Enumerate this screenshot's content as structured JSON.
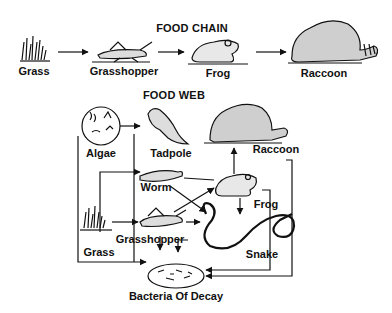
{
  "food_chain": {
    "title": "FOOD CHAIN",
    "nodes": [
      {
        "id": "grass",
        "label": "Grass"
      },
      {
        "id": "grasshopper",
        "label": "Grasshopper"
      },
      {
        "id": "frog",
        "label": "Frog"
      },
      {
        "id": "raccoon",
        "label": "Raccoon"
      }
    ],
    "edges": [
      [
        "grass",
        "grasshopper"
      ],
      [
        "grasshopper",
        "frog"
      ],
      [
        "frog",
        "raccoon"
      ]
    ]
  },
  "food_web": {
    "title": "FOOD WEB",
    "nodes": [
      {
        "id": "algae",
        "label": "Algae"
      },
      {
        "id": "tadpole",
        "label": "Tadpole"
      },
      {
        "id": "raccoon",
        "label": "Raccoon"
      },
      {
        "id": "worm",
        "label": "Worm"
      },
      {
        "id": "frog",
        "label": "Frog"
      },
      {
        "id": "grass",
        "label": "Grass"
      },
      {
        "id": "grasshopper",
        "label": "Grasshopper"
      },
      {
        "id": "snake",
        "label": "Snake"
      },
      {
        "id": "bacteria",
        "label": "Bacteria Of Decay"
      }
    ],
    "edges": [
      [
        "algae",
        "tadpole"
      ],
      [
        "grass",
        "worm"
      ],
      [
        "grass",
        "grasshopper"
      ],
      [
        "worm",
        "frog"
      ],
      [
        "worm",
        "snake"
      ],
      [
        "grasshopper",
        "frog"
      ],
      [
        "grasshopper",
        "snake"
      ],
      [
        "frog",
        "raccoon"
      ],
      [
        "frog",
        "snake"
      ],
      [
        "algae",
        "bacteria"
      ],
      [
        "tadpole",
        "bacteria"
      ],
      [
        "grasshopper",
        "bacteria"
      ],
      [
        "grass",
        "bacteria"
      ],
      [
        "raccoon",
        "bacteria"
      ],
      [
        "frog",
        "bacteria"
      ]
    ]
  }
}
